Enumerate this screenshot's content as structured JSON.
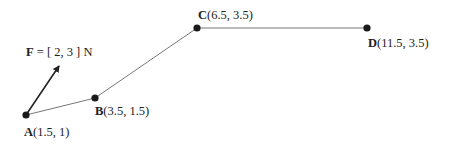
{
  "diagram": {
    "force": {
      "symbol": "F",
      "value_text": " = [ 2, 3 ] N",
      "vector": [
        2,
        3
      ],
      "unit": "N"
    },
    "points": [
      {
        "name": "A",
        "coords_text": "(1.5, 1)",
        "x": 1.5,
        "y": 1
      },
      {
        "name": "B",
        "coords_text": "(3.5, 1.5)",
        "x": 3.5,
        "y": 1.5
      },
      {
        "name": "C",
        "coords_text": "(6.5, 3.5)",
        "x": 6.5,
        "y": 3.5
      },
      {
        "name": "D",
        "coords_text": "(11.5, 3.5)",
        "x": 11.5,
        "y": 3.5
      }
    ],
    "path": [
      "A",
      "B",
      "C",
      "D"
    ],
    "colors": {
      "line": "#777777",
      "point": "#1a1a1a",
      "arrow": "#222222",
      "text": "#222222"
    }
  }
}
